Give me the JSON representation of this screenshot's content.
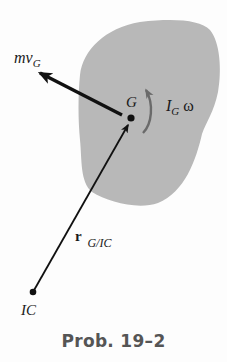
{
  "figure": {
    "body_fill": "#b8b8b8",
    "line_color": "#111111",
    "accent_gray": "#6a6a6a",
    "labels": {
      "momentum": {
        "base": "mv",
        "sub": "G"
      },
      "center_of_mass": "G",
      "angular_momentum": {
        "base": "I",
        "sub": "G",
        "omega": "ω"
      },
      "position_vector": {
        "base": "r",
        "sub": "G/IC"
      },
      "instant_center": "IC"
    },
    "caption": "Prob. 19–2"
  }
}
